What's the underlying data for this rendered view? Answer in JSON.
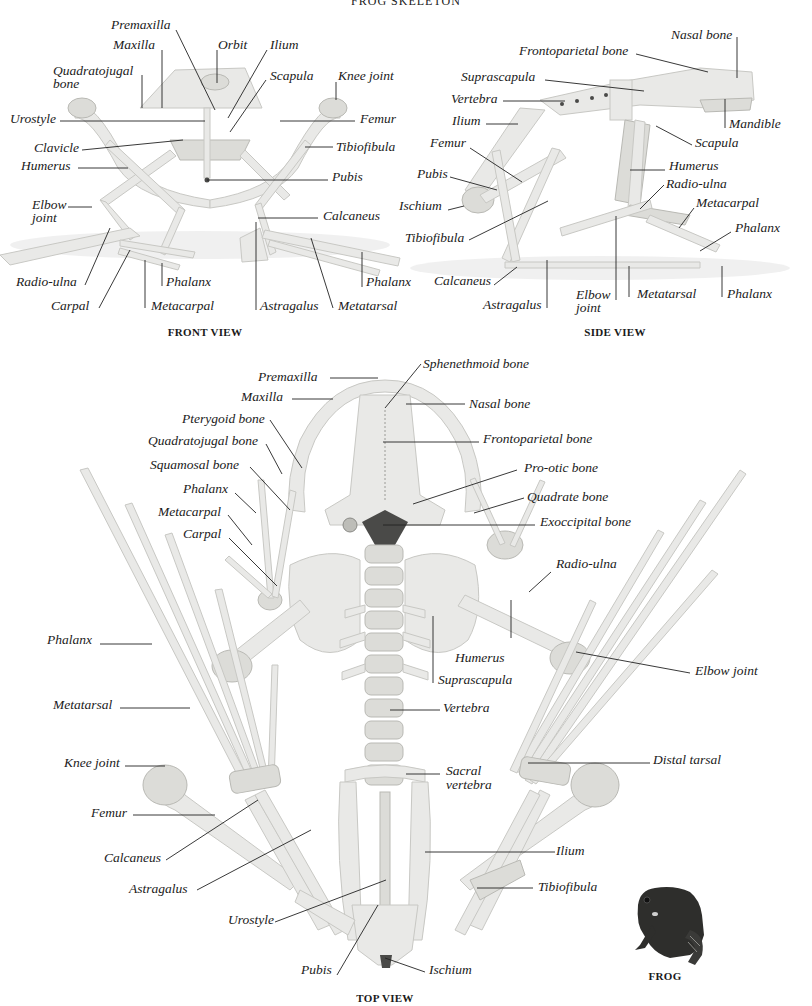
{
  "title": "FROG SKELETON",
  "views": {
    "front": {
      "caption": "FRONT VIEW",
      "labels": {
        "premaxilla": "Premaxilla",
        "maxilla": "Maxilla",
        "orbit": "Orbit",
        "ilium": "Ilium",
        "quadratojugal_1": "Quadratojugal",
        "quadratojugal_2": "bone",
        "scapula": "Scapula",
        "knee_joint": "Knee joint",
        "urostyle": "Urostyle",
        "femur": "Femur",
        "clavicle": "Clavicle",
        "tibiofibula": "Tibiofibula",
        "humerus": "Humerus",
        "pubis": "Pubis",
        "elbow_joint_1": "Elbow",
        "elbow_joint_2": "joint",
        "calcaneus": "Calcaneus",
        "radio_ulna": "Radio-ulna",
        "phalanx_hand": "Phalanx",
        "phalanx_foot": "Phalanx",
        "carpal": "Carpal",
        "metacarpal": "Metacarpal",
        "astragalus": "Astragalus",
        "metatarsal": "Metatarsal"
      }
    },
    "side": {
      "caption": "SIDE VIEW",
      "labels": {
        "nasal_bone": "Nasal bone",
        "frontoparietal_bone": "Frontoparietal bone",
        "suprascapula": "Suprascapula",
        "vertebra": "Vertebra",
        "mandible": "Mandible",
        "ilium": "Ilium",
        "scapula": "Scapula",
        "femur": "Femur",
        "humerus": "Humerus",
        "pubis": "Pubis",
        "radio_ulna": "Radio-ulna",
        "ischium": "Ischium",
        "metacarpal": "Metacarpal",
        "tibiofibula": "Tibiofibula",
        "phalanx_hand": "Phalanx",
        "calcaneus": "Calcaneus",
        "elbow_joint_1": "Elbow",
        "elbow_joint_2": "joint",
        "metatarsal": "Metatarsal",
        "phalanx_foot": "Phalanx",
        "astragalus": "Astragalus"
      }
    },
    "top": {
      "caption": "TOP VIEW",
      "labels": {
        "premaxilla": "Premaxilla",
        "sphenethmoid_bone": "Sphenethmoid bone",
        "maxilla": "Maxilla",
        "nasal_bone": "Nasal bone",
        "pterygoid_bone": "Pterygoid bone",
        "frontoparietal_bone": "Frontoparietal bone",
        "quadratojugal_bone": "Quadratojugal bone",
        "squamosal_bone": "Squamosal bone",
        "pro_otic_bone": "Pro-otic bone",
        "phalanx_hand": "Phalanx",
        "quadrate_bone": "Quadrate bone",
        "metacarpal": "Metacarpal",
        "exoccipital_bone": "Exoccipital bone",
        "carpal": "Carpal",
        "radio_ulna": "Radio-ulna",
        "phalanx_foot": "Phalanx",
        "humerus": "Humerus",
        "elbow_joint": "Elbow joint",
        "suprascapula": "Suprascapula",
        "metatarsal": "Metatarsal",
        "vertebra": "Vertebra",
        "knee_joint": "Knee joint",
        "distal_tarsal": "Distal tarsal",
        "sacral_vertebra_1": "Sacral",
        "sacral_vertebra_2": "vertebra",
        "femur": "Femur",
        "calcaneus": "Calcaneus",
        "ilium": "Ilium",
        "astragalus": "Astragalus",
        "tibiofibula": "Tibiofibula",
        "urostyle": "Urostyle",
        "pubis": "Pubis",
        "ischium": "Ischium"
      }
    }
  },
  "inset": {
    "caption": "FROG",
    "icon": "frog-illustration"
  },
  "colors": {
    "bone": "#e9e9e7",
    "bone_outline": "#c8c8c4",
    "leader_line": "#222222",
    "frog_body": "#2e2e2c",
    "background": "#ffffff"
  }
}
